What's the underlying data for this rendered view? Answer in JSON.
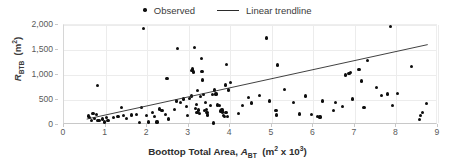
{
  "chart_data": {
    "type": "scatter",
    "title": "",
    "xlabel": "Boottop Total Area, A_BT  (m² x 10³)",
    "ylabel": "R_BTB  (m²)",
    "xlim": [
      0,
      9
    ],
    "ylim": [
      0,
      2000
    ],
    "xticks": [
      "0",
      "1",
      "2",
      "3",
      "4",
      "5",
      "6",
      "7",
      "8",
      "9"
    ],
    "yticks": [
      "0",
      "500",
      "1,000",
      "1,500",
      "2,000"
    ],
    "grid": true,
    "legend_position": "top-center",
    "series": [
      {
        "name": "Observed",
        "type": "scatter",
        "marker": "circle",
        "color": "#0d0d0d",
        "points": [
          [
            0.58,
            180
          ],
          [
            0.62,
            150
          ],
          [
            0.66,
            95
          ],
          [
            0.7,
            235
          ],
          [
            0.74,
            130
          ],
          [
            0.78,
            205
          ],
          [
            0.8,
            795
          ],
          [
            0.82,
            85
          ],
          [
            0.86,
            90
          ],
          [
            0.92,
            120
          ],
          [
            0.98,
            60
          ],
          [
            1.02,
            145
          ],
          [
            1.06,
            95
          ],
          [
            1.2,
            150
          ],
          [
            1.3,
            175
          ],
          [
            1.38,
            350
          ],
          [
            1.44,
            185
          ],
          [
            1.5,
            130
          ],
          [
            1.62,
            200
          ],
          [
            1.74,
            215
          ],
          [
            1.82,
            45
          ],
          [
            1.86,
            345
          ],
          [
            1.92,
            1935
          ],
          [
            1.98,
            195
          ],
          [
            2.04,
            60
          ],
          [
            2.12,
            255
          ],
          [
            2.18,
            170
          ],
          [
            2.24,
            60
          ],
          [
            2.3,
            320
          ],
          [
            2.36,
            290
          ],
          [
            2.44,
            215
          ],
          [
            2.48,
            935
          ],
          [
            2.52,
            120
          ],
          [
            2.66,
            310
          ],
          [
            2.7,
            480
          ],
          [
            2.74,
            1530
          ],
          [
            2.8,
            450
          ],
          [
            2.88,
            520
          ],
          [
            2.94,
            375
          ],
          [
            2.98,
            185
          ],
          [
            3.02,
            525
          ],
          [
            3.06,
            580
          ],
          [
            3.08,
            1085
          ],
          [
            3.1,
            1120
          ],
          [
            3.12,
            1060
          ],
          [
            3.14,
            1555
          ],
          [
            3.16,
            330
          ],
          [
            3.18,
            410
          ],
          [
            3.2,
            255
          ],
          [
            3.22,
            690
          ],
          [
            3.24,
            300
          ],
          [
            3.26,
            235
          ],
          [
            3.28,
            565
          ],
          [
            3.3,
            1330
          ],
          [
            3.32,
            1075
          ],
          [
            3.34,
            900
          ],
          [
            3.36,
            610
          ],
          [
            3.38,
            285
          ],
          [
            3.4,
            450
          ],
          [
            3.42,
            310
          ],
          [
            3.44,
            255
          ],
          [
            3.46,
            200
          ],
          [
            3.52,
            385
          ],
          [
            3.58,
            610
          ],
          [
            3.6,
            40
          ],
          [
            3.62,
            700
          ],
          [
            3.66,
            620
          ],
          [
            3.7,
            400
          ],
          [
            3.74,
            390
          ],
          [
            3.78,
            280
          ],
          [
            3.8,
            300
          ],
          [
            3.82,
            260
          ],
          [
            3.84,
            190
          ],
          [
            3.86,
            170
          ],
          [
            3.88,
            800
          ],
          [
            3.9,
            250
          ],
          [
            3.92,
            1205
          ],
          [
            3.94,
            175
          ],
          [
            3.96,
            700
          ],
          [
            4.0,
            855
          ],
          [
            4.2,
            225
          ],
          [
            4.3,
            385
          ],
          [
            4.44,
            545
          ],
          [
            4.52,
            440
          ],
          [
            4.7,
            585
          ],
          [
            4.88,
            1740
          ],
          [
            4.94,
            480
          ],
          [
            5.1,
            285
          ],
          [
            5.12,
            200
          ],
          [
            5.14,
            1200
          ],
          [
            5.3,
            715
          ],
          [
            5.52,
            455
          ],
          [
            5.66,
            220
          ],
          [
            5.82,
            580
          ],
          [
            5.96,
            205
          ],
          [
            6.1,
            175
          ],
          [
            6.16,
            160
          ],
          [
            6.22,
            480
          ],
          [
            6.48,
            290
          ],
          [
            6.54,
            455
          ],
          [
            6.7,
            370
          ],
          [
            6.78,
            1000
          ],
          [
            6.86,
            1035
          ],
          [
            6.9,
            1045
          ],
          [
            6.94,
            520
          ],
          [
            7.1,
            1115
          ],
          [
            7.16,
            880
          ],
          [
            7.22,
            355
          ],
          [
            7.3,
            1295
          ],
          [
            7.52,
            745
          ],
          [
            7.64,
            595
          ],
          [
            7.78,
            620
          ],
          [
            7.86,
            1975
          ],
          [
            7.9,
            395
          ],
          [
            8.02,
            625
          ],
          [
            8.36,
            1175
          ],
          [
            8.56,
            105
          ],
          [
            8.58,
            195
          ],
          [
            8.62,
            250
          ],
          [
            8.72,
            430
          ]
        ]
      },
      {
        "name": "Linear trendline",
        "type": "line",
        "color": "#2b2b2b",
        "x_start": 0.55,
        "y_start": 80,
        "x_end": 8.8,
        "y_end": 1600
      }
    ],
    "legend": [
      {
        "label": "Observed",
        "marker": "dot"
      },
      {
        "label": "Linear trendline",
        "marker": "line"
      }
    ]
  }
}
